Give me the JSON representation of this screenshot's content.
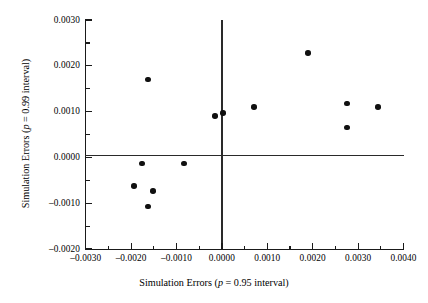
{
  "chart_data": {
    "type": "scatter",
    "title": "",
    "xlabel": "Simulation Errors (p = 0.95 interval)",
    "ylabel": "Simulation Errors (p = 0.99 interval)",
    "xlabel_parts": {
      "pre": "Simulation Errors (",
      "italic": "p",
      "post": " = 0.95 interval)"
    },
    "ylabel_parts": {
      "pre": "Simulation Errors (",
      "italic": "p",
      "post": " = 0.99 interval)"
    },
    "xlim": [
      -0.003,
      0.004
    ],
    "ylim": [
      -0.002,
      0.003
    ],
    "xticks": [
      -0.003,
      -0.002,
      -0.001,
      0.0,
      0.001,
      0.002,
      0.003,
      0.004
    ],
    "xtick_labels": [
      "-0.0030",
      "-0.0020",
      "-0.0010",
      "0.0000",
      "0.0010",
      "0.0020",
      "0.0030",
      "0.0040"
    ],
    "xminor_ticks": [
      -0.0025,
      -0.0015,
      -0.0005,
      0.0005,
      0.0015,
      0.0025,
      0.0035
    ],
    "yticks": [
      -0.002,
      -0.001,
      0.0,
      0.001,
      0.002,
      0.003
    ],
    "ytick_labels": [
      "-0.0020",
      "-0.0010",
      "0.0000",
      "0.0010",
      "0.0020",
      "0.0030"
    ],
    "yminor_ticks": [
      -0.0015,
      -0.0005,
      0.0005,
      0.0015,
      0.0025
    ],
    "grid": false,
    "legend": "none",
    "reference_lines": {
      "horizontal": 0.0,
      "vertical": 0.0
    },
    "marker": {
      "shape": "circle",
      "color": "#101010",
      "size": 5.6
    },
    "points": [
      {
        "x": -0.00194,
        "y": -0.00062
      },
      {
        "x": -0.00163,
        "y": 0.0017
      },
      {
        "x": -0.00163,
        "y": -0.00107
      },
      {
        "x": -0.00152,
        "y": -0.00073
      },
      {
        "x": -0.00176,
        "y": -0.00013
      },
      {
        "x": -0.00084,
        "y": -0.00013
      },
      {
        "x": -0.00015,
        "y": 0.0009
      },
      {
        "x": 3e-05,
        "y": 0.00097
      },
      {
        "x": 0.00071,
        "y": 0.0011
      },
      {
        "x": 0.0019,
        "y": 0.00228
      },
      {
        "x": 0.00276,
        "y": 0.00118
      },
      {
        "x": 0.00276,
        "y": 0.00065
      },
      {
        "x": 0.00344,
        "y": 0.0011
      }
    ],
    "n_points": 13
  },
  "figure": {
    "background_color": "#ffffff",
    "axis_color": "#1a1a1a"
  }
}
